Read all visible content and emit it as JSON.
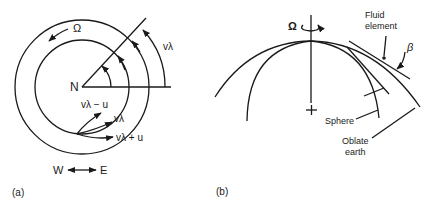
{
  "panel_a": {
    "caption": "(a)",
    "center_label": "N",
    "rotation_label": "Ω",
    "arc_label": "vλ",
    "velocity_labels": {
      "minus": "vλ − u",
      "mid": "vλ",
      "plus": "vλ + u"
    },
    "direction": {
      "west": "W",
      "east": "E"
    }
  },
  "panel_b": {
    "caption": "(b)",
    "rotation_label": "Ω",
    "fluid_element_line1": "Fluid",
    "fluid_element_line2": "element",
    "angle_label": "β",
    "sphere_label": "Sphere",
    "oblate_line1": "Oblate",
    "oblate_line2": "earth"
  }
}
